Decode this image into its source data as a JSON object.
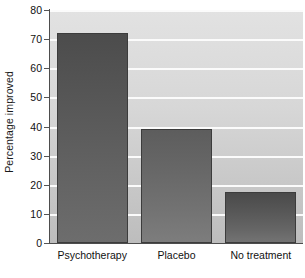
{
  "chart_data": {
    "type": "bar",
    "title": "",
    "xlabel": "",
    "ylabel": "Percentage improved",
    "categories": [
      "Psychotherapy",
      "Placebo",
      "No treatment"
    ],
    "values": [
      72,
      39,
      17.5
    ],
    "ylim": [
      0,
      80
    ],
    "ytick_labels": [
      "0",
      "10",
      "20",
      "30",
      "40",
      "50",
      "60",
      "70",
      "80"
    ],
    "ytick_values": [
      0,
      10,
      20,
      30,
      40,
      50,
      60,
      70,
      80
    ],
    "grid": true,
    "gridlines_at": [
      10,
      20,
      30,
      40,
      50,
      60,
      70,
      80
    ],
    "legend": "none",
    "series": [
      {
        "name": "Percentage improved",
        "values": [
          72,
          39,
          17.5
        ]
      }
    ],
    "colors": {
      "bar_fill_top": "#4c4c4c",
      "bar_fill_bottom": "#6f6f6f",
      "bar_border": "#3c3c3c",
      "plot_background": "#d4d4d4",
      "gridline": "#fbfbfb",
      "axis": "#4d4d4d",
      "text": "#111111",
      "page_background": "#ffffff"
    }
  }
}
